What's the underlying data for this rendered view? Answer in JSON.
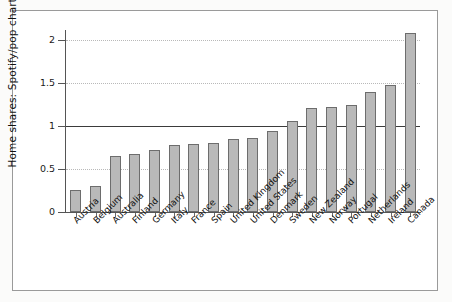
{
  "chart_data": {
    "type": "bar",
    "title": "",
    "xlabel": "",
    "ylabel": "Home shares: Spotify/pop charts",
    "ylim": [
      0,
      2.2
    ],
    "yticks": [
      0,
      0.5,
      1,
      1.5,
      2
    ],
    "ytick_labels": [
      "0",
      "0.5",
      "1",
      "1.5",
      "2"
    ],
    "grid": "horizontal-dotted",
    "reference_line": 1,
    "legend": "none",
    "bar_fill_color": "#b9b9b9",
    "bar_edge_color": "#6d6d6d",
    "categories": [
      "Austria",
      "Belgium",
      "Australia",
      "Finland",
      "Germany",
      "Italy",
      "France",
      "Spain",
      "United Kingdom",
      "United States",
      "Denmark",
      "Sweden",
      "New Zealand",
      "Norway",
      "Portugal",
      "Netherlands",
      "Ireland",
      "Canada"
    ],
    "values": [
      0.26,
      0.3,
      0.65,
      0.68,
      0.72,
      0.78,
      0.79,
      0.8,
      0.85,
      0.86,
      0.94,
      1.06,
      1.21,
      1.22,
      1.24,
      1.4,
      1.48,
      2.08
    ]
  }
}
